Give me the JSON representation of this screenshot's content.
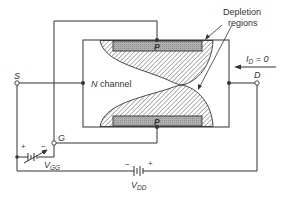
{
  "diagram": {
    "labels": {
      "depletion_line1": "Depletion",
      "depletion_line2": "regions",
      "channel": "N channel",
      "channel_letter": "N",
      "channel_word": " channel",
      "gate_top": "P",
      "gate_bottom": "P",
      "source": "S",
      "drain": "D",
      "gate": "G",
      "id_main": "I",
      "id_sub": "D",
      "id_value": " = 0",
      "vgg_main": "V",
      "vgg_sub": "GG",
      "vdd_main": "V",
      "vdd_sub": "DD",
      "plus": "+",
      "minus": "−"
    },
    "colors": {
      "line": "#333333",
      "p_region": "#a8a8a8",
      "hatch": "#555555",
      "background": "#ffffff"
    }
  }
}
